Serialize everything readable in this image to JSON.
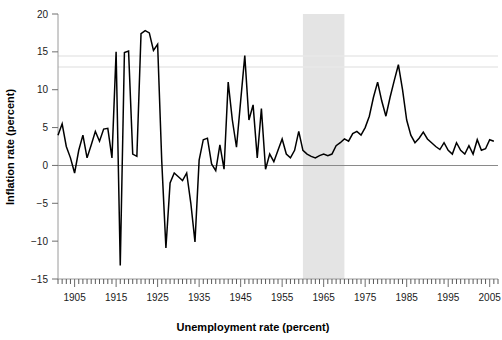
{
  "chart_data": {
    "type": "line",
    "title": "",
    "xlabel": "Unemployment rate (percent)",
    "ylabel": "Inflation rate (percent)",
    "xlim": [
      1901,
      2007
    ],
    "ylim": [
      -15,
      20
    ],
    "grid": false,
    "legend": null,
    "x_ticks": [
      1905,
      1915,
      1925,
      1935,
      1945,
      1955,
      1965,
      1975,
      1985,
      1995,
      2005
    ],
    "x_tick_labels": [
      "1905",
      "1915",
      "1925",
      "1935",
      "1945",
      "1955",
      "1965",
      "1975",
      "1985",
      "1995",
      "2005"
    ],
    "x_minor_tick_interval": 1,
    "y_ticks": [
      -15,
      -10,
      -5,
      0,
      5,
      10,
      15,
      20
    ],
    "y_tick_labels": [
      "−15",
      "−10",
      "−5",
      "0",
      "5",
      "10",
      "15",
      "20"
    ],
    "zero_reference_line": 0,
    "shaded_regions": [
      {
        "name": "highlight-band",
        "x_start": 1960,
        "x_end": 1970,
        "color": "#e4e4e4"
      }
    ],
    "line_color": "#000000",
    "series": [
      {
        "name": "Inflation rate",
        "x": [
          1901,
          1902,
          1903,
          1904,
          1905,
          1906,
          1907,
          1908,
          1909,
          1910,
          1911,
          1912,
          1913,
          1914,
          1915,
          1916,
          1917,
          1918,
          1919,
          1920,
          1921,
          1922,
          1923,
          1924,
          1925,
          1926,
          1927,
          1928,
          1929,
          1930,
          1931,
          1932,
          1933,
          1934,
          1935,
          1936,
          1937,
          1938,
          1939,
          1940,
          1941,
          1942,
          1943,
          1944,
          1945,
          1946,
          1947,
          1948,
          1949,
          1950,
          1951,
          1952,
          1953,
          1954,
          1955,
          1956,
          1957,
          1958,
          1959,
          1960,
          1961,
          1962,
          1963,
          1964,
          1965,
          1966,
          1967,
          1968,
          1969,
          1970,
          1971,
          1972,
          1973,
          1974,
          1975,
          1976,
          1977,
          1978,
          1979,
          1980,
          1981,
          1982,
          1983,
          1984,
          1985,
          1986,
          1987,
          1988,
          1989,
          1990,
          1991,
          1992,
          1993,
          1994,
          1995,
          1996,
          1997,
          1998,
          1999,
          2000,
          2001,
          2002,
          2003,
          2004,
          2005,
          2006
        ],
        "values": [
          4.0,
          5.5,
          2.5,
          1.0,
          -1.0,
          2.0,
          4.0,
          1.0,
          2.7,
          4.5,
          3.2,
          4.8,
          4.9,
          1.0,
          15.0,
          -13.2,
          14.9,
          15.1,
          1.5,
          1.2,
          17.4,
          17.8,
          17.5,
          15.2,
          16.0,
          0.5,
          -10.9,
          -2.3,
          -1.0,
          -1.5,
          -2.0,
          -1.0,
          -5.0,
          -10.1,
          0.7,
          3.4,
          3.6,
          0.2,
          -0.7,
          2.7,
          -0.5,
          11.0,
          6.0,
          2.4,
          8.5,
          14.5,
          6.0,
          8.0,
          1.0,
          7.5,
          -0.5,
          1.5,
          0.5,
          2.0,
          3.5,
          1.5,
          1.0,
          2.0,
          4.5,
          2.0,
          1.5,
          1.2,
          1.0,
          1.3,
          1.5,
          1.3,
          1.5,
          2.6,
          3.0,
          3.5,
          3.2,
          4.2,
          4.5,
          4.0,
          5.0,
          6.5,
          9.0,
          11.0,
          8.5,
          6.5,
          9.0,
          11.2,
          13.3,
          10.0,
          6.0,
          4.0,
          3.0,
          3.6,
          4.4,
          3.5,
          3.0,
          2.5,
          2.1,
          3.0,
          2.0,
          1.5,
          3.0,
          2.0,
          1.5,
          2.6,
          1.5,
          3.4,
          2.0,
          2.2,
          3.4,
          3.2
        ]
      }
    ]
  },
  "axis": {
    "y_title": "Inflation rate (percent)",
    "x_title": "Unemployment rate (percent)"
  }
}
